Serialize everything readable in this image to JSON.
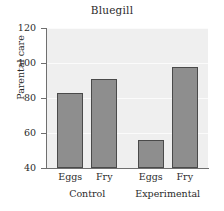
{
  "chart_data": {
    "type": "bar",
    "title": "Bluegill",
    "xlabel": "",
    "ylabel": "Parental care",
    "ylim": [
      40,
      120
    ],
    "yticks": [
      40,
      60,
      80,
      100,
      120
    ],
    "grid": true,
    "legend": null,
    "groups": [
      {
        "name": "Control",
        "categories": [
          "Eggs",
          "Fry"
        ],
        "values": [
          83,
          91
        ]
      },
      {
        "name": "Experimental",
        "categories": [
          "Eggs",
          "Fry"
        ],
        "values": [
          56,
          98
        ]
      }
    ],
    "categories": [
      "Eggs",
      "Fry",
      "Eggs",
      "Fry"
    ],
    "values": [
      83,
      91,
      56,
      98
    ],
    "bar_color": "#8e8e8e",
    "bar_edge_color": "#4a4a4a",
    "plot_background": "#efefef"
  },
  "axis": {
    "yticklabels": [
      "40",
      "60",
      "80",
      "100",
      "120"
    ],
    "xticklabels": [
      "Eggs",
      "Fry",
      "Eggs",
      "Fry"
    ],
    "grouplabels": [
      "Control",
      "Experimental"
    ]
  }
}
